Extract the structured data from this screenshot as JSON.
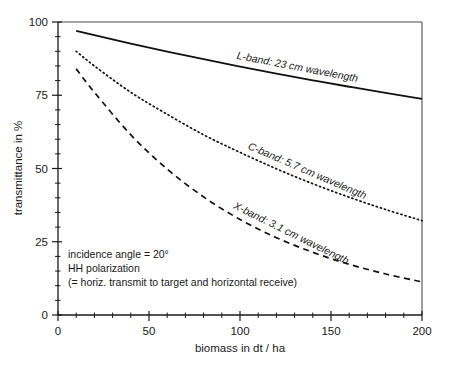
{
  "chart_data": {
    "type": "line",
    "title": "",
    "xlabel": "biomass in dt / ha",
    "ylabel": "transmittance in %",
    "xlim": [
      0,
      200
    ],
    "ylim": [
      0,
      100
    ],
    "xticks": [
      "0",
      "50",
      "100",
      "150",
      "200"
    ],
    "yticks": [
      "0",
      "25",
      "50",
      "75",
      "100"
    ],
    "xtick_values": [
      0,
      50,
      100,
      150,
      200
    ],
    "ytick_values": [
      0,
      25,
      50,
      75,
      100
    ],
    "x_minor_step": 10,
    "y_minor_step": 5,
    "grid": false,
    "legend_position": "inline-on-curve",
    "series": [
      {
        "name": "L-band: 23 cm wavelength",
        "label": "L-band: 23 cm wavelength",
        "style": "solid",
        "x": [
          10,
          20,
          40,
          60,
          80,
          100,
          120,
          140,
          160,
          180,
          200
        ],
        "values": [
          97.0,
          95.5,
          92.6,
          89.9,
          87.3,
          84.8,
          82.4,
          80.1,
          77.9,
          75.8,
          73.8
        ]
      },
      {
        "name": "C-band: 5.7 cm wavelength",
        "label": "C-band:  5.7 cm wavelength",
        "style": "dotted",
        "x": [
          10,
          20,
          40,
          60,
          80,
          100,
          120,
          140,
          160,
          180,
          200
        ],
        "values": [
          90.0,
          85.0,
          76.0,
          68.5,
          61.5,
          55.5,
          49.9,
          44.8,
          40.2,
          36.0,
          32.2
        ]
      },
      {
        "name": "X-band: 3.1 cm wavelength",
        "label": "X-band: 3.1 cm wavelength",
        "style": "dashed",
        "x": [
          10,
          20,
          40,
          60,
          80,
          100,
          120,
          140,
          160,
          180,
          200
        ],
        "values": [
          84.0,
          76.0,
          61.5,
          49.8,
          40.3,
          32.6,
          26.4,
          21.4,
          17.3,
          14.0,
          11.3
        ]
      }
    ],
    "annotations": [
      "incidence angle = 20°",
      "HH polarization",
      "(= horiz. transmit to target and horizontal  receive)"
    ],
    "colors": {
      "line": "#111111",
      "frame": "#4d4d4d",
      "text": "#1a1a1a",
      "background": "#ffffff"
    }
  }
}
